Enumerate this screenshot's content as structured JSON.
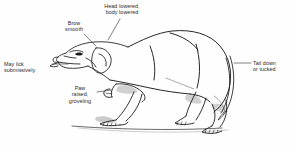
{
  "figure": {
    "style": "black and white line drawing",
    "background_color": "#fefefe",
    "line_color": "#1a1a1a",
    "text_color": "#2b2b2b",
    "shading_color": "#8c8c8c",
    "width": 295,
    "height": 149
  },
  "annotations": [
    {
      "id": "head-lowered",
      "lines": [
        "Head lowered,",
        "body lowered"
      ],
      "text": "Head lowered, body lowered",
      "align": "center",
      "x": 96,
      "y": 3,
      "leader": {
        "x1": 120,
        "y1": 19,
        "x2": 108,
        "y2": 40
      }
    },
    {
      "id": "brow-smooth",
      "lines": [
        "Brow",
        "smooth"
      ],
      "text": "Brow smooth",
      "align": "center",
      "x": 54,
      "y": 20,
      "leader": {
        "x1": 84,
        "y1": 34,
        "x2": 96,
        "y2": 46
      }
    },
    {
      "id": "may-lick-submissively",
      "lines": [
        "May lick",
        "submissively"
      ],
      "text": "May lick submissively",
      "align": "right",
      "x": 4,
      "y": 61,
      "leader": {
        "x1": 52,
        "y1": 64,
        "x2": 68,
        "y2": 64
      }
    },
    {
      "id": "paw-raised-groveling",
      "lines": [
        "Paw",
        "raised,",
        "groveling"
      ],
      "text": "Paw raised, groveling",
      "align": "center",
      "x": 62,
      "y": 85,
      "leader": {
        "x1": 97,
        "y1": 92,
        "x2": 112,
        "y2": 90
      }
    },
    {
      "id": "tail-down-or-tucked",
      "lines": [
        "Tail down",
        "or tucked"
      ],
      "text": "Tail down or tucked",
      "align": "left",
      "x": 253,
      "y": 60,
      "leader": {
        "x1": 234,
        "y1": 63,
        "x2": 251,
        "y2": 63
      }
    }
  ]
}
